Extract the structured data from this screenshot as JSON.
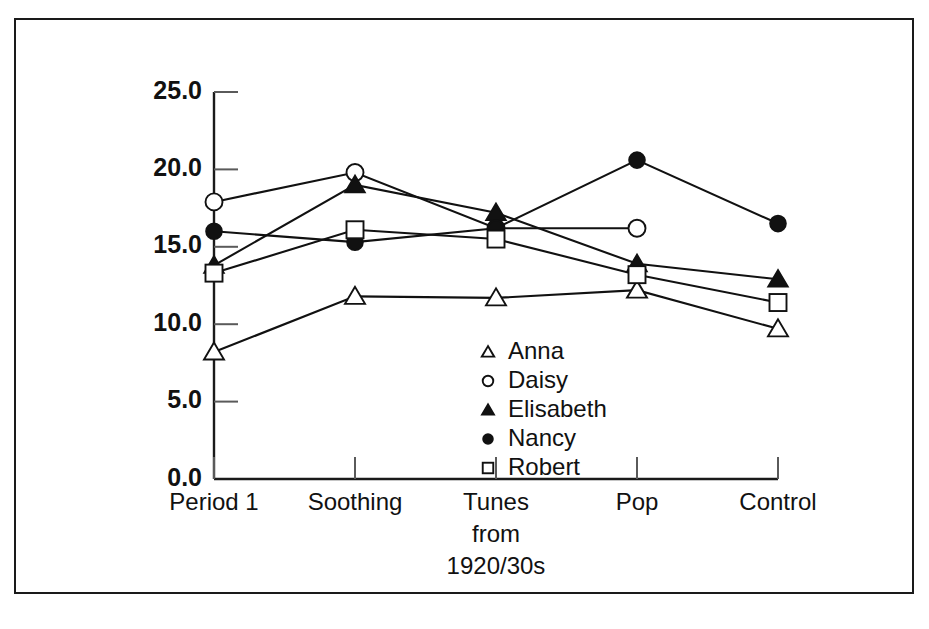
{
  "chart_data": {
    "type": "line",
    "title": "",
    "subtitle": "",
    "xlabel": "",
    "ylabel": "",
    "ylim": [
      0.0,
      25.0
    ],
    "y_ticks": [
      "0.0",
      "5.0",
      "10.0",
      "15.0",
      "20.0",
      "25.0"
    ],
    "y_tick_values": [
      0.0,
      5.0,
      10.0,
      15.0,
      20.0,
      25.0
    ],
    "grid": false,
    "legend_position": "center",
    "categories": [
      "Period 1",
      "Soothing",
      "Tunes from 1920/30s",
      "Pop",
      "Control"
    ],
    "category_lines": [
      [
        "Period 1"
      ],
      [
        "Soothing"
      ],
      [
        "Tunes",
        "from",
        "1920/30s"
      ],
      [
        "Pop"
      ],
      [
        "Control"
      ]
    ],
    "series": [
      {
        "name": "Anna",
        "marker": "open-triangle",
        "values": [
          8.2,
          11.8,
          11.7,
          12.2,
          9.7
        ]
      },
      {
        "name": "Daisy",
        "marker": "open-circle",
        "values": [
          17.9,
          19.8,
          16.2,
          16.2,
          null
        ]
      },
      {
        "name": "Elisabeth",
        "marker": "filled-triangle",
        "values": [
          13.8,
          19.0,
          17.2,
          13.9,
          12.9
        ]
      },
      {
        "name": "Nancy",
        "marker": "filled-circle",
        "values": [
          16.0,
          15.3,
          16.2,
          20.6,
          16.5
        ]
      },
      {
        "name": "Robert",
        "marker": "open-square",
        "values": [
          13.3,
          16.1,
          15.5,
          13.2,
          11.4
        ]
      }
    ]
  },
  "legend": {
    "items": [
      {
        "label": "Anna",
        "marker": "open-triangle"
      },
      {
        "label": "Daisy",
        "marker": "open-circle"
      },
      {
        "label": "Elisabeth",
        "marker": "filled-triangle"
      },
      {
        "label": "Nancy",
        "marker": "filled-circle"
      },
      {
        "label": "Robert",
        "marker": "open-square"
      }
    ]
  },
  "colors": {
    "ink": "#111111",
    "frame": "#1a1a1a",
    "background": "#ffffff",
    "tick": "#5a5a5a"
  }
}
